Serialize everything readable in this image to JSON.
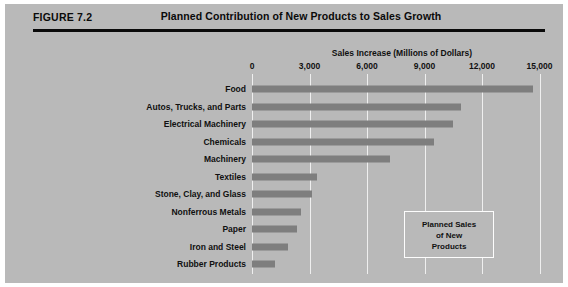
{
  "figure": {
    "tag": "FIGURE 7.2",
    "title": "Planned Contribution of New Products to Sales Growth"
  },
  "legend": {
    "line1": "Planned Sales",
    "line2": "of New",
    "line3": "Products"
  },
  "colors": {
    "panel_background": "#b9b9b9",
    "bar_fill": "#7e7e7e",
    "gridline": "#efefef",
    "text": "#101010",
    "rule": "#0a0a0a"
  },
  "chart_data": {
    "type": "bar",
    "orientation": "horizontal",
    "title": "Planned Contribution of New Products to Sales Growth",
    "xlabel": "Sales Increase (Millions of Dollars)",
    "ylabel": "",
    "xlim": [
      0,
      15000
    ],
    "xticks": [
      0,
      3000,
      6000,
      9000,
      12000,
      15000
    ],
    "xtick_labels": [
      "0",
      "3,000",
      "6,000",
      "9,000",
      "12,000",
      "15,000"
    ],
    "grid": true,
    "grid_axis": "x",
    "legend_position": "inside-lower-right",
    "legend_entries": [
      "Planned Sales of New Products"
    ],
    "categories": [
      "Food",
      "Autos, Trucks, and Parts",
      "Electrical Machinery",
      "Chemicals",
      "Machinery",
      "Textiles",
      "Stone, Clay, and Glass",
      "Nonferrous Metals",
      "Paper",
      "Iron and Steel",
      "Rubber Products"
    ],
    "values": [
      14650,
      10900,
      10500,
      9500,
      7200,
      3400,
      3150,
      2550,
      2350,
      1900,
      1200
    ]
  }
}
